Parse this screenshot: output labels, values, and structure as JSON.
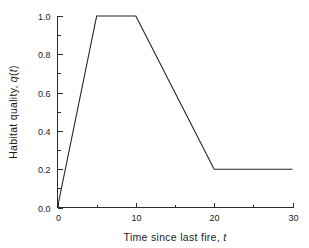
{
  "chart_data": {
    "type": "line",
    "title": "",
    "xlabel": "Time since last fire, t",
    "xlabel_plain": "Time since last fire, ",
    "xlabel_italic": "t",
    "ylabel": "Habitat quality, q(t)",
    "ylabel_plain": "Habitat quality, ",
    "ylabel_italic_q": "q",
    "ylabel_paren_open": "(",
    "ylabel_italic_t": "t",
    "ylabel_paren_close": ")",
    "x": [
      0,
      5,
      10,
      20,
      30
    ],
    "values": [
      0.0,
      1.0,
      1.0,
      0.2,
      0.2
    ],
    "series": [
      {
        "name": "q(t)",
        "points": [
          {
            "x": 0,
            "y": 0.0
          },
          {
            "x": 5,
            "y": 1.0
          },
          {
            "x": 10,
            "y": 1.0
          },
          {
            "x": 20,
            "y": 0.2
          },
          {
            "x": 30,
            "y": 0.2
          }
        ]
      }
    ],
    "xlim": [
      0,
      30
    ],
    "ylim": [
      0.0,
      1.0
    ],
    "x_ticks_major": [
      0,
      10,
      20,
      30
    ],
    "x_tick_labels": [
      "0",
      "10",
      "20",
      "30"
    ],
    "x_ticks_minor": [
      5,
      15,
      25
    ],
    "y_ticks_major": [
      0.0,
      0.2,
      0.4,
      0.6,
      0.8,
      1.0
    ],
    "y_tick_labels": [
      "0.0",
      "0.2",
      "0.4",
      "0.6",
      "0.8",
      "1.0"
    ],
    "y_ticks_minor": [
      0.1,
      0.3,
      0.5,
      0.7,
      0.9
    ],
    "grid": false,
    "legend": "none",
    "line_color": "#232323",
    "axis_color": "#2b2b2b",
    "background_color": "#ffffff"
  }
}
